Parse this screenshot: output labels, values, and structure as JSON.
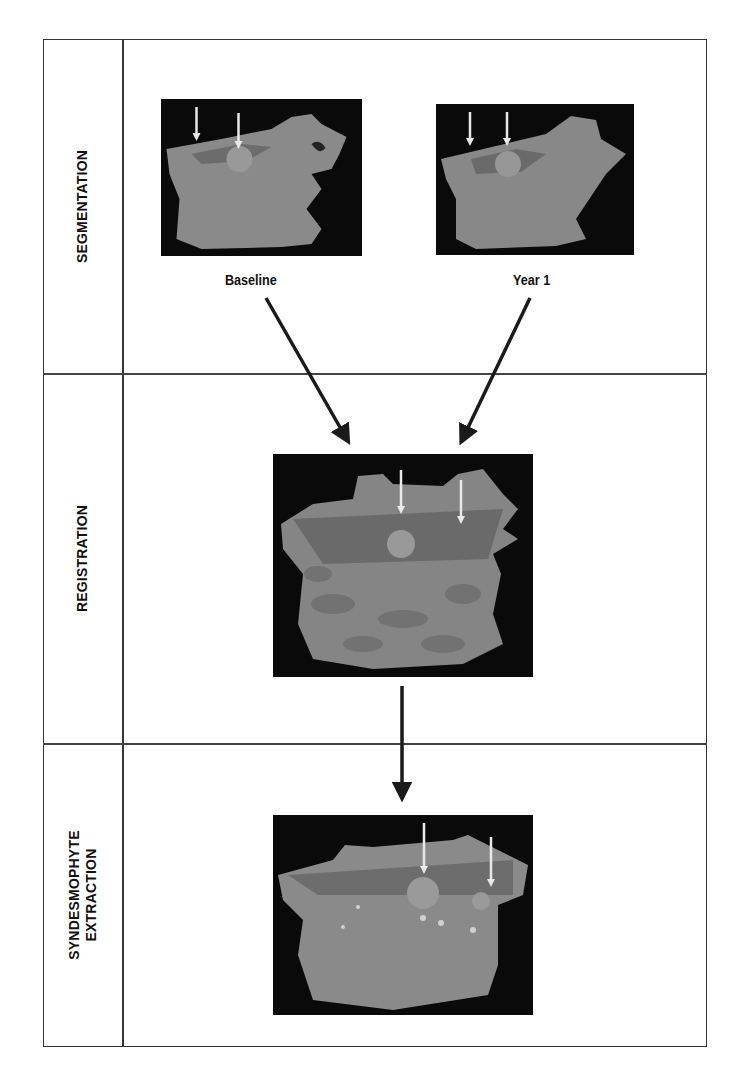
{
  "rows": [
    {
      "label": "SEGMENTATION"
    },
    {
      "label": "REGISTRATION"
    },
    {
      "label_line1": "SYNDESMOPHYTE",
      "label_line2": "EXTRACTION"
    }
  ],
  "segmentation": {
    "images": [
      {
        "caption": "Baseline",
        "icon": "vertebra-render-baseline"
      },
      {
        "caption": "Year 1",
        "icon": "vertebra-render-year1"
      }
    ]
  },
  "registration": {
    "icon": "vertebra-render-registered"
  },
  "extraction": {
    "icon": "vertebra-render-syndesmophytes"
  },
  "colors": {
    "border": "#333333",
    "image_bg": "#0a0a0a",
    "bone": "#8a8a8a",
    "arrow": "#1a1a1a",
    "marker_arrow": "#e8e8e8"
  }
}
